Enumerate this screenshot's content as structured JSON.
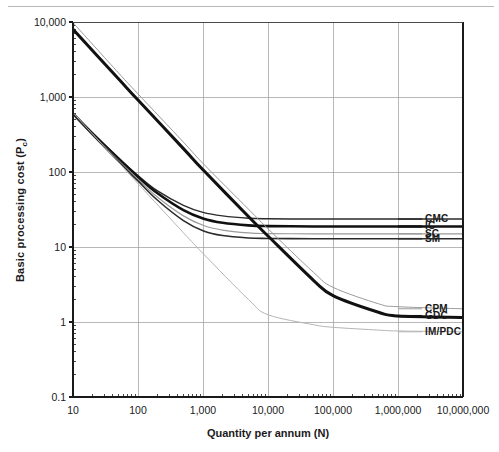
{
  "chart_data": {
    "type": "line",
    "title": "",
    "xlabel": "Quantity per annum (N)",
    "ylabel": "Basic processing cost (Pc)",
    "ylabel_main": "Basic processing cost (P",
    "ylabel_sub": "c",
    "ylabel_tail": ")",
    "xscale": "log",
    "yscale": "log",
    "xlim": [
      10,
      10000000
    ],
    "ylim": [
      0.1,
      10000
    ],
    "grid": true,
    "legend_position": "right-inline-labels",
    "xticks": [
      "10",
      "100",
      "1,000",
      "10,000",
      "100,000",
      "1,000,000",
      "10,000,000"
    ],
    "xtick_values": [
      10,
      100,
      1000,
      10000,
      100000,
      1000000,
      10000000
    ],
    "yticks": [
      "10,000",
      "1,000",
      "100",
      "10",
      "1",
      "0.1"
    ],
    "ytick_values": [
      10000,
      1000,
      100,
      10,
      1,
      0.1
    ],
    "series": [
      {
        "name": "CMC",
        "label": "CMC",
        "color": "#2b2b2b",
        "width": 1.4,
        "x": [
          10,
          20,
          50,
          100,
          200,
          500,
          1000,
          2000,
          5000,
          10000,
          50000,
          100000,
          1000000,
          10000000
        ],
        "y": [
          600,
          330,
          155,
          90,
          56,
          36,
          29,
          26,
          24.2,
          23.8,
          23.6,
          23.6,
          23.6,
          23.6
        ]
      },
      {
        "name": "IC",
        "label": "IC",
        "color": "#111111",
        "width": 2.6,
        "x": [
          10,
          20,
          50,
          100,
          200,
          500,
          1000,
          2000,
          5000,
          10000,
          50000,
          100000,
          1000000,
          10000000
        ],
        "y": [
          600,
          325,
          150,
          86,
          52,
          31,
          24,
          21,
          19.4,
          19.0,
          18.8,
          18.8,
          18.8,
          18.8
        ]
      },
      {
        "name": "SC",
        "label": "SC",
        "color": "#9b9b9b",
        "width": 1.2,
        "x": [
          10,
          20,
          50,
          100,
          200,
          500,
          1000,
          2000,
          5000,
          10000,
          50000,
          100000,
          1000000,
          10000000
        ],
        "y": [
          580,
          315,
          143,
          80,
          46,
          26,
          19.5,
          16.8,
          15.4,
          15.1,
          15.0,
          15.0,
          15.0,
          15.0
        ]
      },
      {
        "name": "SM",
        "label": "SM",
        "color": "#2b2b2b",
        "width": 1.6,
        "x": [
          10,
          20,
          50,
          100,
          200,
          500,
          1000,
          2000,
          5000,
          10000,
          50000,
          100000,
          1000000,
          10000000
        ],
        "y": [
          590,
          312,
          138,
          76,
          42,
          22.5,
          16.5,
          14.2,
          13.2,
          13.0,
          12.9,
          12.9,
          12.9,
          12.9
        ]
      },
      {
        "name": "CPM",
        "label": "CPM",
        "color": "#9b9b9b",
        "width": 1.0,
        "x": [
          10,
          50,
          100,
          500,
          1000,
          5000,
          10000,
          50000,
          100000,
          500000,
          1000000,
          10000000
        ],
        "y": [
          9800,
          2100,
          1100,
          250,
          130,
          32,
          17.5,
          4.6,
          2.9,
          1.75,
          1.6,
          1.5
        ]
      },
      {
        "name": "GDC",
        "label": "GDC",
        "color": "#111111",
        "width": 3.0,
        "x": [
          10,
          50,
          100,
          500,
          1000,
          5000,
          10000,
          50000,
          100000,
          500000,
          1000000,
          10000000
        ],
        "y": [
          8000,
          1750,
          910,
          205,
          107,
          25.5,
          14.0,
          3.6,
          2.25,
          1.35,
          1.2,
          1.15
        ]
      },
      {
        "name": "IM/PDC",
        "label": "IM/PDC",
        "color": "#b5b5b5",
        "width": 1.0,
        "x": [
          10,
          50,
          100,
          500,
          1000,
          5000,
          10000,
          50000,
          100000,
          500000,
          1000000,
          10000000
        ],
        "y": [
          620,
          135,
          70,
          15.5,
          8.2,
          2.0,
          1.25,
          0.92,
          0.85,
          0.78,
          0.76,
          0.74
        ]
      }
    ],
    "legend_entries": [
      {
        "label": "CMC",
        "value": 23.6
      },
      {
        "label": "IC",
        "value": 18.8
      },
      {
        "label": "SC",
        "value": 15.0
      },
      {
        "label": "SM",
        "value": 12.9
      },
      {
        "label": "CPM",
        "value": 1.5
      },
      {
        "label": "GDC",
        "value": 1.2
      },
      {
        "label": "IM/PDC",
        "value": 0.74
      }
    ],
    "colors": {
      "axis": "#1a1a1a",
      "grid": "#9a9a9a",
      "background": "#ffffff",
      "dark_line": "#111111",
      "light_line": "#9b9b9b"
    }
  }
}
